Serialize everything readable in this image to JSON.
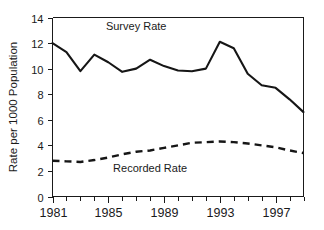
{
  "chart_data": {
    "type": "line",
    "title": "",
    "subtitle": "",
    "xlabel": "",
    "ylabel": "Rate per 1000 Population",
    "xlim": [
      1981,
      1999
    ],
    "ylim": [
      0,
      14
    ],
    "grid": false,
    "legend_position": "inline-annotations",
    "x": [
      1981,
      1982,
      1983,
      1984,
      1985,
      1986,
      1987,
      1988,
      1989,
      1990,
      1991,
      1992,
      1993,
      1994,
      1995,
      1996,
      1997,
      1998,
      1999
    ],
    "x_tick_labels": [
      "1981",
      "1985",
      "1989",
      "1993",
      "1997"
    ],
    "x_tick_values": [
      1981,
      1985,
      1989,
      1993,
      1997
    ],
    "x_minor_ticks": [
      1982,
      1983,
      1984,
      1986,
      1987,
      1988,
      1990,
      1991,
      1992,
      1994,
      1995,
      1996,
      1998,
      1999
    ],
    "y_tick_labels": [
      "0",
      "2",
      "4",
      "6",
      "8",
      "10",
      "12",
      "14"
    ],
    "y_tick_values": [
      0,
      2,
      4,
      6,
      8,
      10,
      12,
      14
    ],
    "series": [
      {
        "name": "Survey Rate",
        "style": "solid",
        "color": "#161616",
        "label_x": 1987,
        "label_y": 13.0,
        "values": [
          12.0,
          11.3,
          9.8,
          11.1,
          10.5,
          9.75,
          10.0,
          10.7,
          10.2,
          9.85,
          9.8,
          10.0,
          12.1,
          11.6,
          9.6,
          8.7,
          8.5,
          7.6,
          6.6
        ]
      },
      {
        "name": "Recorded Rate",
        "style": "dashed",
        "color": "#161616",
        "label_x": 1988,
        "label_y": 1.9,
        "values": [
          2.8,
          2.75,
          2.7,
          2.85,
          3.05,
          3.3,
          3.5,
          3.6,
          3.8,
          4.0,
          4.2,
          4.25,
          4.3,
          4.25,
          4.15,
          4.0,
          3.85,
          3.6,
          3.4
        ]
      }
    ]
  },
  "annotations": {
    "survey_rate_label": "Survey Rate",
    "recorded_rate_label": "Recorded Rate"
  },
  "axes": {
    "y_axis_title": "Rate per 1000 Population"
  }
}
